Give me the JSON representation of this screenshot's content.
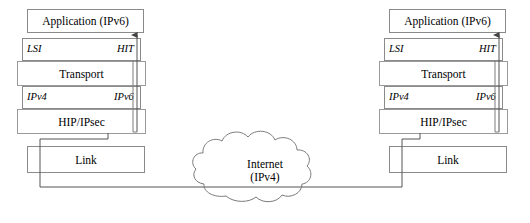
{
  "diagram": {
    "colors": {
      "box_border": "#8a8a8a",
      "line": "#555555",
      "cloud_stroke": "#7a7a7a",
      "text": "#000000",
      "background": "#ffffff"
    },
    "cloud": {
      "name": "internet-cloud",
      "line1": "Internet",
      "line2": "(IPv4)"
    },
    "stacks": [
      {
        "id": "left",
        "name": "left-host-stack",
        "layers": {
          "application": "Application (IPv6)",
          "identifier_left": "LSI",
          "identifier_right": "HIT",
          "transport": "Transport",
          "address_left": "IPv4",
          "address_right": "IPv6",
          "hip": "HIP/IPsec",
          "link": "Link"
        }
      },
      {
        "id": "right",
        "name": "right-host-stack",
        "layers": {
          "application": "Application (IPv6)",
          "identifier_left": "LSI",
          "identifier_right": "HIT",
          "transport": "Transport",
          "address_left": "IPv4",
          "address_right": "IPv6",
          "hip": "HIP/IPsec",
          "link": "Link"
        }
      }
    ]
  }
}
